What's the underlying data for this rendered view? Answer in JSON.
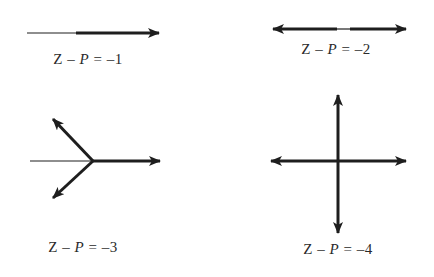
{
  "figure": {
    "panels": [
      {
        "id": "panel-1",
        "label": {
          "Z": "Z",
          "minus": " – ",
          "P": "P",
          "rest": " = –1"
        },
        "value": -1,
        "description": "Single thick arrow pointing right"
      },
      {
        "id": "panel-2",
        "label": {
          "Z": "Z",
          "minus": " – ",
          "P": "P",
          "rest": " = –2"
        },
        "value": -2,
        "description": "Two arrows pointing left and right"
      },
      {
        "id": "panel-3",
        "label": {
          "Z": "Z",
          "minus": " – ",
          "P": "P",
          "rest": " = –3"
        },
        "value": -3,
        "description": "Three arrows at 120° spacing: right, upper-left, lower-left"
      },
      {
        "id": "panel-4",
        "label": {
          "Z": "Z",
          "minus": " – ",
          "P": "P",
          "rest": " = –4"
        },
        "value": -4,
        "description": "Four arrows: left, right, up, down"
      }
    ],
    "colors": {
      "line": "#1e1e1e",
      "text": "#2a2a2a",
      "background": "#ffffff"
    }
  }
}
